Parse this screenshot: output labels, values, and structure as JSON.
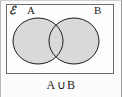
{
  "figure": {
    "kind": "venn-diagram",
    "caption": "A ∪ B",
    "caption_parts": {
      "left_set": "A",
      "operator": "∪",
      "right_set": "B"
    },
    "universal_set_label": "ℰ",
    "sets": [
      {
        "name": "A",
        "label": "A",
        "shaded": true
      },
      {
        "name": "B",
        "label": "B",
        "shaded": true
      }
    ],
    "intersection_shaded": true,
    "colors": {
      "shade_fill": "#d9d9d9",
      "outline": "#1a1a1a",
      "rect_border": "#6d6d6d",
      "background": "#fdfdfd",
      "text": "#1d1d1d"
    },
    "geometry": {
      "rect": {
        "x": 6,
        "y": 4,
        "width": 108,
        "height": 70
      },
      "ellipse_a": {
        "cx": 38,
        "cy": 41,
        "rx": 25,
        "ry": 23
      },
      "ellipse_b": {
        "cx": 74,
        "cy": 41,
        "rx": 25,
        "ry": 23
      }
    }
  }
}
